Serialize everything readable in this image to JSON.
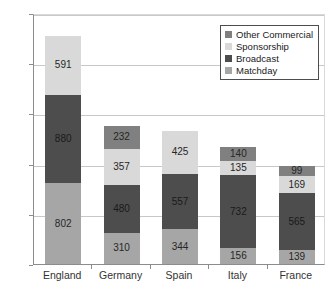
{
  "chart_data": {
    "type": "bar",
    "subtype": "stacked-bar",
    "title": "",
    "xlabel": "",
    "ylabel": "",
    "categories": [
      "England",
      "Germany",
      "Spain",
      "Italy",
      "France"
    ],
    "ylim": [
      0,
      2500
    ],
    "yticks": [
      0,
      500,
      1000,
      1500,
      2000,
      2500
    ],
    "ytick_labels": [
      "0",
      "500",
      "1000",
      "1500",
      "2000",
      "2500"
    ],
    "grid": true,
    "legend_position": "top-right",
    "series": [
      {
        "name": "Matchday",
        "color": "#a6a6a6",
        "values": [
          802,
          310,
          344,
          156,
          139
        ],
        "labels": [
          "802",
          "310",
          "344",
          "156",
          "139"
        ]
      },
      {
        "name": "Broadcast",
        "color": "#4d4d4d",
        "values": [
          880,
          480,
          557,
          732,
          565
        ],
        "labels": [
          "880",
          "480",
          "557",
          "732",
          "565"
        ]
      },
      {
        "name": "Sponsorship",
        "color": "#d9d9d9",
        "values": [
          591,
          357,
          425,
          135,
          169
        ],
        "labels": [
          "591",
          "357",
          "425",
          "135",
          "169"
        ]
      },
      {
        "name": "Other Commercial",
        "color": "#808080",
        "values": [
          0,
          232,
          0,
          140,
          99
        ],
        "labels": [
          "",
          "232",
          "",
          "140",
          "99"
        ]
      }
    ],
    "totals": [
      2273,
      1379,
      1326,
      1163,
      972
    ],
    "legend_entries": [
      {
        "label": "Other Commercial",
        "color": "#808080"
      },
      {
        "label": "Sponsorship",
        "color": "#d9d9d9"
      },
      {
        "label": "Broadcast",
        "color": "#4d4d4d"
      },
      {
        "label": "Matchday",
        "color": "#a6a6a6"
      }
    ]
  }
}
